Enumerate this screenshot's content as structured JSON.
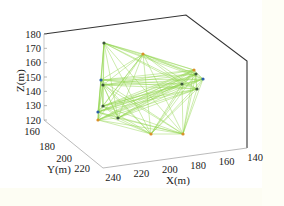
{
  "chart_data": {
    "type": "scatter3d",
    "title": "",
    "xlabel": "X(m)",
    "ylabel": "Y(m)",
    "zlabel": "Z(m)",
    "xlim": [
      140,
      240
    ],
    "ylim": [
      160,
      220
    ],
    "zlim": [
      120,
      180
    ],
    "xticks": [
      "240",
      "220",
      "200",
      "180",
      "160",
      "140"
    ],
    "yticks": [
      "160",
      "180",
      "200",
      "220"
    ],
    "zticks": [
      "180",
      "170",
      "160",
      "150",
      "140",
      "130",
      "120"
    ],
    "grid": false,
    "legend": null,
    "line_color": "#8fd44a",
    "node_colors": {
      "blue": "#2d5fa8",
      "orange": "#d9902a",
      "dark": "#3d5a3a"
    },
    "nodes": [
      {
        "id": 1,
        "px": 104,
        "py": 43,
        "color": "dark"
      },
      {
        "id": 2,
        "px": 143,
        "py": 54,
        "color": "orange"
      },
      {
        "id": 3,
        "px": 194,
        "py": 70,
        "color": "orange"
      },
      {
        "id": 4,
        "px": 196,
        "py": 74,
        "color": "dark"
      },
      {
        "id": 5,
        "px": 203,
        "py": 79,
        "color": "blue"
      },
      {
        "id": 6,
        "px": 182,
        "py": 84,
        "color": "dark"
      },
      {
        "id": 7,
        "px": 197,
        "py": 89,
        "color": "dark"
      },
      {
        "id": 8,
        "px": 101,
        "py": 80,
        "color": "blue"
      },
      {
        "id": 9,
        "px": 103,
        "py": 85,
        "color": "dark"
      },
      {
        "id": 10,
        "px": 103,
        "py": 106,
        "color": "dark"
      },
      {
        "id": 11,
        "px": 98,
        "py": 112,
        "color": "blue"
      },
      {
        "id": 12,
        "px": 118,
        "py": 118,
        "color": "dark"
      },
      {
        "id": 13,
        "px": 98,
        "py": 120,
        "color": "orange"
      },
      {
        "id": 14,
        "px": 151,
        "py": 134,
        "color": "orange"
      },
      {
        "id": 15,
        "px": 183,
        "py": 134,
        "color": "orange"
      }
    ]
  }
}
